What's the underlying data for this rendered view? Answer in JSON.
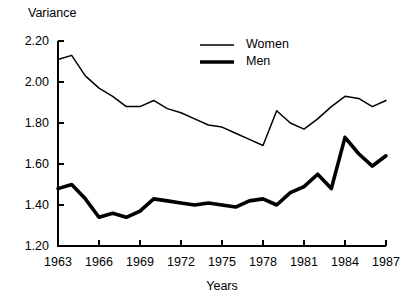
{
  "chart_data": {
    "type": "line",
    "title": "",
    "ylabel": "Variance",
    "xlabel": "Years",
    "ylim": [
      1.2,
      2.2
    ],
    "xlim": [
      1963,
      1987
    ],
    "grid": false,
    "legend_position": "top-center",
    "ytick_labels": [
      "2.20",
      "2.00",
      "1.80",
      "1.60",
      "1.40",
      "1.20"
    ],
    "ytick_values": [
      2.2,
      2.0,
      1.8,
      1.6,
      1.4,
      1.2
    ],
    "xtick_labels": [
      "1963",
      "1966",
      "1969",
      "1972",
      "1975",
      "1978",
      "1981",
      "1984",
      "1987"
    ],
    "xtick_values": [
      1963,
      1966,
      1969,
      1972,
      1975,
      1978,
      1981,
      1984,
      1987
    ],
    "x": [
      1963,
      1964,
      1965,
      1966,
      1967,
      1968,
      1969,
      1970,
      1971,
      1972,
      1973,
      1974,
      1975,
      1976,
      1977,
      1978,
      1979,
      1980,
      1981,
      1982,
      1983,
      1984,
      1985,
      1986,
      1987
    ],
    "series": [
      {
        "name": "Women",
        "style": "thin",
        "values": [
          2.11,
          2.13,
          2.03,
          1.97,
          1.93,
          1.88,
          1.88,
          1.91,
          1.87,
          1.85,
          1.82,
          1.79,
          1.78,
          1.75,
          1.72,
          1.69,
          1.86,
          1.8,
          1.77,
          1.82,
          1.88,
          1.93,
          1.92,
          1.88,
          1.91
        ]
      },
      {
        "name": "Men",
        "style": "thick",
        "values": [
          1.48,
          1.5,
          1.43,
          1.34,
          1.36,
          1.34,
          1.37,
          1.43,
          1.42,
          1.41,
          1.4,
          1.41,
          1.4,
          1.39,
          1.42,
          1.43,
          1.4,
          1.46,
          1.49,
          1.55,
          1.48,
          1.73,
          1.65,
          1.59,
          1.64
        ]
      }
    ],
    "legend": [
      {
        "label": "Women",
        "style": "thin"
      },
      {
        "label": "Men",
        "style": "thick"
      }
    ]
  },
  "layout": {
    "plot_left": 58,
    "plot_right": 386,
    "plot_top": 41,
    "plot_bottom": 246
  }
}
